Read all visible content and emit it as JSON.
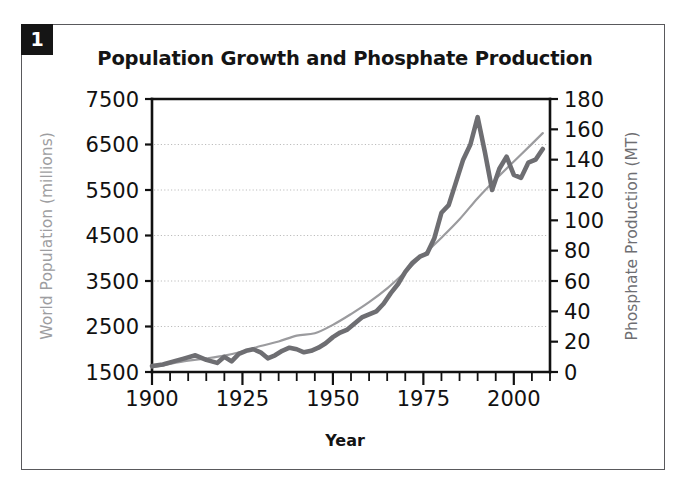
{
  "figure": {
    "badge_number": "1",
    "title": "Population Growth and Phosphate Production",
    "frame_color": "#59595c",
    "background": "#ffffff"
  },
  "chart_data": {
    "type": "line",
    "title": "Population Growth and Phosphate Production",
    "xlabel": "Year",
    "grid": true,
    "grid_axis": "y",
    "legend": "none",
    "xlim": [
      1900,
      2010
    ],
    "x_major_ticks": [
      1900,
      1925,
      1950,
      1975,
      2000
    ],
    "x_major_tick_labels": [
      "1900",
      "1925",
      "1950",
      "1975",
      "2000"
    ],
    "x_minor_tick_step": 5,
    "axes": [
      {
        "id": "left",
        "label": "World Population (millions)",
        "color": "#9d9da0",
        "ylim": [
          1500,
          7500
        ],
        "ticks": [
          1500,
          2500,
          3500,
          4500,
          5500,
          6500,
          7500
        ],
        "tick_labels": [
          "1500",
          "2500",
          "3500",
          "4500",
          "5500",
          "6500",
          "7500"
        ]
      },
      {
        "id": "right",
        "label": "Phosphate Production (MT)",
        "color": "#6e6e72",
        "ylim": [
          0,
          180
        ],
        "ticks": [
          0,
          20,
          40,
          60,
          80,
          100,
          120,
          140,
          160,
          180
        ],
        "tick_labels": [
          "0",
          "20",
          "40",
          "60",
          "80",
          "100",
          "120",
          "140",
          "160",
          "180"
        ]
      }
    ],
    "series": [
      {
        "name": "World Population (millions)",
        "axis": "left",
        "color": "#9b9b9e",
        "style": "thin-smooth",
        "x": [
          1900,
          1905,
          1910,
          1915,
          1920,
          1925,
          1930,
          1935,
          1940,
          1945,
          1950,
          1955,
          1960,
          1965,
          1970,
          1975,
          1980,
          1985,
          1990,
          1995,
          2000,
          2005,
          2008
        ],
        "values": [
          1600,
          1680,
          1750,
          1800,
          1860,
          1950,
          2070,
          2170,
          2300,
          2350,
          2536,
          2773,
          3035,
          3339,
          3700,
          4073,
          4451,
          4856,
          5320,
          5735,
          6127,
          6514,
          6750
        ]
      },
      {
        "name": "Phosphate Production (MT)",
        "axis": "right",
        "color": "#6e6e72",
        "style": "thick-jagged",
        "x": [
          1900,
          1903,
          1906,
          1909,
          1912,
          1915,
          1918,
          1920,
          1922,
          1924,
          1926,
          1928,
          1930,
          1932,
          1934,
          1936,
          1938,
          1940,
          1942,
          1944,
          1946,
          1948,
          1950,
          1952,
          1954,
          1956,
          1958,
          1960,
          1962,
          1964,
          1966,
          1968,
          1970,
          1972,
          1974,
          1976,
          1978,
          1980,
          1982,
          1984,
          1986,
          1988,
          1990,
          1992,
          1994,
          1996,
          1998,
          2000,
          2002,
          2004,
          2006,
          2008
        ],
        "values": [
          4,
          5,
          7,
          9,
          11,
          8,
          6,
          10,
          7,
          12,
          14,
          15,
          13,
          9,
          11,
          14,
          16,
          15,
          13,
          14,
          16,
          19,
          23,
          26,
          28,
          32,
          36,
          38,
          40,
          45,
          52,
          58,
          66,
          72,
          76,
          78,
          88,
          105,
          110,
          125,
          140,
          150,
          168,
          145,
          120,
          134,
          142,
          130,
          128,
          138,
          140,
          147
        ]
      }
    ],
    "annotations": []
  }
}
